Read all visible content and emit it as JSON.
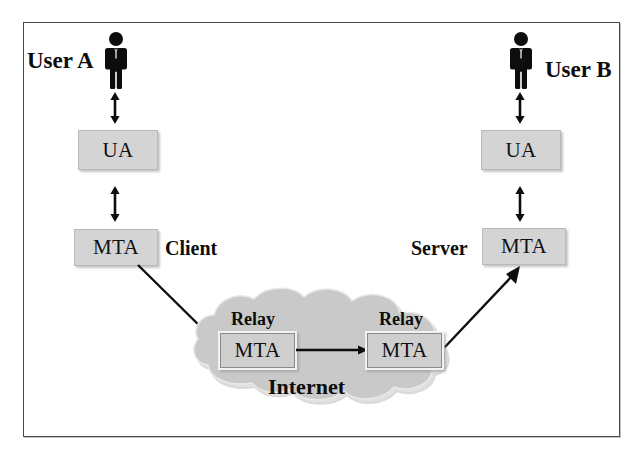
{
  "diagram": {
    "frame": {
      "name": "diagram-border"
    },
    "endpoints": [
      {
        "id": "user-a",
        "label": "User A",
        "side": "left"
      },
      {
        "id": "user-b",
        "label": "User B",
        "side": "right"
      }
    ],
    "nodes": [
      {
        "id": "ua-left",
        "label": "UA",
        "side": "left"
      },
      {
        "id": "ua-right",
        "label": "UA",
        "side": "right"
      },
      {
        "id": "mta-client",
        "label": "MTA",
        "side": "left"
      },
      {
        "id": "mta-server",
        "label": "MTA",
        "side": "right"
      },
      {
        "id": "mta-relay-1",
        "label": "MTA",
        "side": "cloud-left"
      },
      {
        "id": "mta-relay-2",
        "label": "MTA",
        "side": "cloud-right"
      }
    ],
    "roles": [
      {
        "id": "client-role",
        "label": "Client"
      },
      {
        "id": "server-role",
        "label": "Server"
      }
    ],
    "relay_captions": [
      {
        "id": "relay-caption-1",
        "label": "Relay"
      },
      {
        "id": "relay-caption-2",
        "label": "Relay"
      }
    ],
    "cloud": {
      "id": "internet-cloud",
      "label": "Internet"
    },
    "connectors": [
      {
        "id": "ua-left-to-user-a",
        "type": "double-arrow-vertical"
      },
      {
        "id": "ua-left-to-mta-client",
        "type": "double-arrow-vertical"
      },
      {
        "id": "ua-right-to-user-b",
        "type": "double-arrow-vertical"
      },
      {
        "id": "ua-right-to-mta-server",
        "type": "double-arrow-vertical"
      },
      {
        "id": "mta-client-to-relay-1",
        "type": "single-arrow-diagonal"
      },
      {
        "id": "relay-1-to-relay-2",
        "type": "single-arrow-horizontal"
      },
      {
        "id": "relay-2-to-mta-server",
        "type": "single-arrow-diagonal"
      }
    ],
    "colors": {
      "box_fill": "#d4d4d4",
      "cloud_fill": "#c9c9c9",
      "stroke": "#1a1a1a",
      "frame": "#4a4a4a",
      "text": "#0d0d0d",
      "page_background": "#ffffff"
    }
  }
}
